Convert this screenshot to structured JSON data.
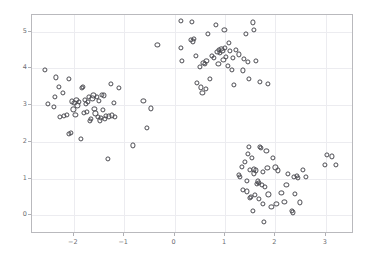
{
  "chart_data": {
    "type": "scatter",
    "title": "",
    "xlabel": "",
    "ylabel": "",
    "xlim": [
      -2.83,
      3.56
    ],
    "ylim": [
      -0.51,
      5.45
    ],
    "grid": true,
    "legend": null,
    "marker": {
      "style": "open-circle",
      "edge_color": "#4a4a50",
      "face_color": "none",
      "size_px": 5.2
    },
    "frame_color": "#b9b9bd",
    "grid_color": "#ececf0",
    "tick_label_color": "#6d6d72",
    "xticks": [
      -2,
      -1,
      0,
      1,
      2,
      3
    ],
    "xtick_labels": [
      "−2",
      "−1",
      "0",
      "1",
      "2",
      "3"
    ],
    "yticks": [
      0,
      1,
      2,
      3,
      4,
      5
    ],
    "ytick_labels": [
      "0",
      "1",
      "2",
      "3",
      "4",
      "5"
    ],
    "series": [
      {
        "name": "cluster-left",
        "points": [
          [
            -2.57,
            3.95
          ],
          [
            -2.52,
            3.02
          ],
          [
            -2.35,
            3.75
          ],
          [
            -2.38,
            3.21
          ],
          [
            -2.3,
            3.5
          ],
          [
            -2.4,
            2.95
          ],
          [
            -2.27,
            2.68
          ],
          [
            -2.22,
            3.32
          ],
          [
            -2.19,
            2.7
          ],
          [
            -2.13,
            2.73
          ],
          [
            -2.1,
            3.7
          ],
          [
            -2.09,
            2.21
          ],
          [
            -2.06,
            2.24
          ],
          [
            -2.04,
            3.1
          ],
          [
            -2.01,
            2.88
          ],
          [
            -1.99,
            3.05
          ],
          [
            -1.97,
            2.74
          ],
          [
            -1.95,
            3.13
          ],
          [
            -1.93,
            2.99
          ],
          [
            -1.9,
            3.08
          ],
          [
            -1.86,
            2.08
          ],
          [
            -1.84,
            3.47
          ],
          [
            -1.82,
            3.49
          ],
          [
            -1.8,
            2.78
          ],
          [
            -1.78,
            3.14
          ],
          [
            -1.76,
            3.04
          ],
          [
            -1.74,
            2.82
          ],
          [
            -1.72,
            3.08
          ],
          [
            -1.7,
            3.22
          ],
          [
            -1.68,
            2.56
          ],
          [
            -1.66,
            2.62
          ],
          [
            -1.63,
            3.18
          ],
          [
            -1.61,
            3.26
          ],
          [
            -1.59,
            2.9
          ],
          [
            -1.57,
            2.77
          ],
          [
            -1.55,
            3.23
          ],
          [
            -1.53,
            2.68
          ],
          [
            -1.5,
            3.12
          ],
          [
            -1.48,
            2.58
          ],
          [
            -1.46,
            2.64
          ],
          [
            -1.44,
            3.27
          ],
          [
            -1.42,
            2.86
          ],
          [
            -1.4,
            3.26
          ],
          [
            -1.38,
            2.62
          ],
          [
            -1.36,
            2.7
          ],
          [
            -1.33,
            1.53
          ],
          [
            -1.3,
            2.69
          ],
          [
            -1.27,
            3.58
          ],
          [
            -1.24,
            2.72
          ],
          [
            -1.21,
            3.06
          ],
          [
            -1.18,
            2.68
          ],
          [
            -1.1,
            3.47
          ],
          [
            -0.83,
            1.9
          ],
          [
            -0.62,
            3.11
          ],
          [
            -0.55,
            2.38
          ],
          [
            -0.47,
            2.91
          ]
        ]
      },
      {
        "name": "cluster-top",
        "points": [
          [
            -0.34,
            4.63
          ],
          [
            0.12,
            5.28
          ],
          [
            0.13,
            4.55
          ],
          [
            0.15,
            4.2
          ],
          [
            0.35,
            5.27
          ],
          [
            0.33,
            4.78
          ],
          [
            0.36,
            4.73
          ],
          [
            0.38,
            4.81
          ],
          [
            0.42,
            4.34
          ],
          [
            0.45,
            3.6
          ],
          [
            0.5,
            4.04
          ],
          [
            0.52,
            3.48
          ],
          [
            0.55,
            3.34
          ],
          [
            0.57,
            4.14
          ],
          [
            0.6,
            4.11
          ],
          [
            0.63,
            4.21
          ],
          [
            0.66,
            4.93
          ],
          [
            0.7,
            3.71
          ],
          [
            0.74,
            4.34
          ],
          [
            0.78,
            4.29
          ],
          [
            0.82,
            5.19
          ],
          [
            0.85,
            4.45
          ],
          [
            0.88,
            4.5
          ],
          [
            0.9,
            4.41
          ],
          [
            0.93,
            4.52
          ],
          [
            0.95,
            4.48
          ],
          [
            0.97,
            4.22
          ],
          [
            0.99,
            5.04
          ],
          [
            1.0,
            4.56
          ],
          [
            1.02,
            4.32
          ],
          [
            1.05,
            4.06
          ],
          [
            1.08,
            4.69
          ],
          [
            1.1,
            4.47
          ],
          [
            1.13,
            3.95
          ],
          [
            1.16,
            4.29
          ],
          [
            1.18,
            3.54
          ],
          [
            1.22,
            4.49
          ],
          [
            1.28,
            4.38
          ],
          [
            1.35,
            3.94
          ],
          [
            1.38,
            4.26
          ],
          [
            1.42,
            4.93
          ],
          [
            1.45,
            4.18
          ],
          [
            1.48,
            3.7
          ],
          [
            1.55,
            5.25
          ],
          [
            1.58,
            5.05
          ],
          [
            1.62,
            4.2
          ],
          [
            1.7,
            3.63
          ],
          [
            1.85,
            3.58
          ],
          [
            0.62,
            3.44
          ],
          [
            0.87,
            4.12
          ]
        ]
      },
      {
        "name": "cluster-bottom-right",
        "points": [
          [
            1.28,
            1.1
          ],
          [
            1.3,
            1.04
          ],
          [
            1.33,
            1.32
          ],
          [
            1.36,
            0.7
          ],
          [
            1.4,
            1.46
          ],
          [
            1.43,
            0.93
          ],
          [
            1.45,
            1.68
          ],
          [
            1.48,
            1.86
          ],
          [
            1.5,
            1.23
          ],
          [
            1.52,
            0.5
          ],
          [
            1.54,
            1.55
          ],
          [
            1.55,
            0.12
          ],
          [
            1.57,
            1.25
          ],
          [
            1.58,
            1.14
          ],
          [
            1.6,
            0.55
          ],
          [
            1.62,
            1.22
          ],
          [
            1.63,
            0.85
          ],
          [
            1.65,
            0.92
          ],
          [
            1.67,
            0.88
          ],
          [
            1.68,
            0.45
          ],
          [
            1.7,
            1.86
          ],
          [
            1.72,
            1.84
          ],
          [
            1.74,
            0.83
          ],
          [
            1.75,
            1.18
          ],
          [
            1.76,
            0.3
          ],
          [
            1.77,
            -0.19
          ],
          [
            1.8,
            0.78
          ],
          [
            1.82,
            1.76
          ],
          [
            1.84,
            1.28
          ],
          [
            1.86,
            0.57
          ],
          [
            1.92,
            0.22
          ],
          [
            1.95,
            1.55
          ],
          [
            2.0,
            1.3
          ],
          [
            2.02,
            0.32
          ],
          [
            2.05,
            1.22
          ],
          [
            2.12,
            0.6
          ],
          [
            2.18,
            0.37
          ],
          [
            2.22,
            0.82
          ],
          [
            2.25,
            1.12
          ],
          [
            2.32,
            0.11
          ],
          [
            2.34,
            0.08
          ],
          [
            2.36,
            1.05
          ],
          [
            2.38,
            0.58
          ],
          [
            2.42,
            1.08
          ],
          [
            2.44,
            1.02
          ],
          [
            2.48,
            0.35
          ],
          [
            2.55,
            1.24
          ],
          [
            2.6,
            1.05
          ],
          [
            2.98,
            1.36
          ],
          [
            3.02,
            1.64
          ],
          [
            3.12,
            1.6
          ],
          [
            3.2,
            1.37
          ],
          [
            1.44,
            0.65
          ],
          [
            1.5,
            0.48
          ]
        ]
      }
    ]
  }
}
